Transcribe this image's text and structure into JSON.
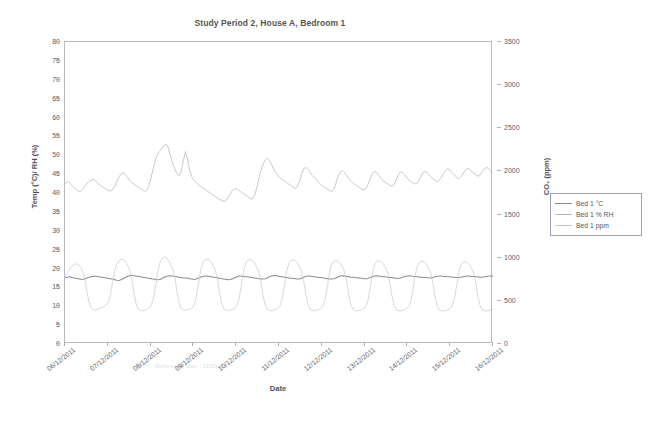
{
  "chart_data": {
    "type": "line",
    "title": "Study Period 2, House A, Bedroom 1",
    "xlabel": "Date",
    "ylabel": "Temp (°C)/ RH (%)",
    "y2label": "CO₂ (ppm)",
    "ylim": [
      0,
      80
    ],
    "y2lim": [
      0,
      3500
    ],
    "grid": false,
    "legend_position": "right",
    "y_ticks": [
      80,
      75,
      70,
      65,
      60,
      55,
      50,
      45,
      40,
      35,
      30,
      25,
      20,
      15,
      10,
      5,
      0
    ],
    "y2_ticks": [
      3500,
      3000,
      2500,
      2000,
      1500,
      1000,
      500,
      0
    ],
    "x_tick_labels": [
      "06/12/2011",
      "07/12/2011",
      "08/12/2011",
      "09/12/2011",
      "10/12/2011",
      "11/12/2011",
      "12/12/2011",
      "13/12/2011",
      "14/12/2011",
      "15/12/2011",
      "16/12/2011"
    ],
    "annotation": "Reference Max - 1100ppm",
    "series": [
      {
        "name": "Bed 1 °C",
        "axis": "left",
        "unit": "°C",
        "color": "#8d8d96",
        "values": [
          17.6,
          17.7,
          17.8,
          17.7,
          17.5,
          17.4,
          17.3,
          17.2,
          17.1,
          17.2,
          17.4,
          17.6,
          17.8,
          17.9,
          18.0,
          17.9,
          17.8,
          17.7,
          17.6,
          17.5,
          17.4,
          17.3,
          17.2,
          17.1,
          16.9,
          16.8,
          17.0,
          17.3,
          17.6,
          17.9,
          18.1,
          18.2,
          18.1,
          18.0,
          17.9,
          17.8,
          17.7,
          17.6,
          17.5,
          17.4,
          17.3,
          17.2,
          17.1,
          17.0,
          17.1,
          17.3,
          17.6,
          17.9,
          18.0,
          18.1,
          18.0,
          17.9,
          17.8,
          17.7,
          17.6,
          17.5,
          17.5,
          17.4,
          17.3,
          17.2,
          17.1,
          17.2,
          17.4,
          17.7,
          17.9,
          18.0,
          18.0,
          17.9,
          17.8,
          17.7,
          17.6,
          17.5,
          17.4,
          17.3,
          17.2,
          17.1,
          17.0,
          17.1,
          17.3,
          17.6,
          17.8,
          18.0,
          18.0,
          17.9,
          17.8,
          17.8,
          17.7,
          17.6,
          17.5,
          17.4,
          17.3,
          17.2,
          17.2,
          17.3,
          17.5,
          17.8,
          18.0,
          18.1,
          18.1,
          18.0,
          17.9,
          17.8,
          17.7,
          17.6,
          17.5,
          17.4,
          17.4,
          17.3,
          17.2,
          17.2,
          17.4,
          17.7,
          17.9,
          18.0,
          18.0,
          17.9,
          17.8,
          17.7,
          17.6,
          17.6,
          17.5,
          17.4,
          17.3,
          17.2,
          17.2,
          17.3,
          17.5,
          17.8,
          18.0,
          18.1,
          18.0,
          17.9,
          17.8,
          17.7,
          17.7,
          17.6,
          17.5,
          17.5,
          17.4,
          17.3,
          17.3,
          17.4,
          17.6,
          17.9,
          18.0,
          18.1,
          18.0,
          17.9,
          17.8,
          17.8,
          17.7,
          17.6,
          17.6,
          17.5,
          17.4,
          17.4,
          17.5,
          17.7,
          17.9,
          18.0,
          18.1,
          18.0,
          17.9,
          17.9,
          17.8,
          17.7,
          17.7,
          17.6,
          17.6,
          17.5,
          17.5,
          17.6,
          17.8,
          17.9,
          18.0,
          18.0,
          17.9,
          17.9,
          17.8,
          17.8,
          17.7,
          17.7,
          17.6,
          17.6,
          17.7,
          17.8,
          17.9,
          18.0,
          18.0,
          17.9,
          17.9,
          17.8,
          17.8,
          17.7,
          17.7,
          17.8,
          17.9,
          18.0,
          18.0,
          17.9
        ]
      },
      {
        "name": "Bed 1 % RH",
        "axis": "left",
        "unit": "%",
        "color": "#b5b5be",
        "values": [
          42.5,
          43.0,
          42.8,
          42.2,
          41.5,
          41.0,
          40.6,
          40.3,
          40.8,
          41.6,
          42.4,
          43.0,
          43.4,
          43.6,
          43.3,
          42.8,
          42.2,
          41.8,
          41.4,
          41.0,
          40.7,
          40.5,
          40.8,
          41.6,
          43.0,
          44.2,
          45.0,
          45.4,
          45.0,
          44.2,
          43.4,
          42.8,
          42.4,
          42.0,
          41.6,
          41.2,
          40.8,
          40.4,
          40.8,
          42.0,
          44.0,
          46.5,
          48.8,
          50.2,
          51.0,
          51.8,
          52.6,
          53.0,
          52.0,
          50.0,
          48.0,
          46.4,
          45.2,
          44.6,
          45.6,
          48.5,
          51.0,
          49.0,
          46.0,
          44.2,
          43.4,
          42.8,
          42.2,
          41.8,
          41.4,
          41.0,
          40.6,
          40.2,
          39.8,
          39.4,
          39.0,
          38.6,
          38.3,
          38.0,
          37.8,
          38.2,
          39.0,
          40.0,
          40.8,
          41.2,
          41.0,
          40.6,
          40.2,
          39.8,
          39.4,
          39.0,
          38.6,
          38.4,
          39.2,
          41.0,
          43.5,
          45.8,
          47.5,
          48.6,
          49.2,
          48.6,
          47.6,
          46.4,
          45.4,
          44.6,
          44.0,
          43.6,
          43.2,
          42.8,
          42.4,
          42.0,
          41.6,
          41.2,
          41.6,
          43.0,
          45.0,
          46.4,
          46.8,
          46.2,
          45.4,
          44.6,
          44.0,
          43.4,
          42.8,
          42.2,
          41.8,
          41.4,
          41.0,
          40.6,
          40.4,
          41.0,
          42.6,
          44.4,
          45.6,
          46.0,
          45.4,
          44.6,
          43.8,
          43.2,
          42.6,
          42.2,
          41.8,
          41.4,
          41.0,
          40.8,
          41.2,
          42.4,
          44.0,
          45.2,
          45.8,
          45.4,
          44.6,
          43.8,
          43.2,
          42.8,
          42.4,
          42.0,
          41.8,
          42.2,
          43.4,
          44.8,
          45.6,
          45.4,
          44.8,
          44.0,
          43.4,
          43.0,
          42.6,
          42.4,
          42.8,
          43.8,
          45.0,
          45.8,
          45.6,
          45.0,
          44.4,
          43.8,
          43.4,
          43.0,
          43.4,
          44.2,
          45.2,
          46.0,
          46.4,
          46.0,
          45.4,
          44.8,
          44.2,
          43.8,
          44.2,
          45.0,
          46.0,
          46.6,
          46.4,
          45.8,
          45.2,
          44.8,
          44.4,
          44.8,
          45.6,
          46.4,
          46.8,
          46.4,
          45.8,
          45.2
        ]
      },
      {
        "name": "Bed 1 ppm",
        "axis": "right",
        "unit": "ppm",
        "color": "#c2c6d6",
        "values": [
          780,
          820,
          860,
          900,
          920,
          930,
          920,
          900,
          860,
          780,
          640,
          500,
          430,
          400,
          395,
          400,
          410,
          420,
          430,
          450,
          480,
          560,
          700,
          840,
          920,
          960,
          980,
          980,
          960,
          920,
          860,
          760,
          600,
          470,
          410,
          390,
          385,
          390,
          400,
          415,
          440,
          520,
          660,
          820,
          930,
          990,
          1010,
          1000,
          970,
          930,
          880,
          780,
          620,
          480,
          415,
          395,
          390,
          395,
          405,
          420,
          450,
          540,
          690,
          850,
          940,
          975,
          985,
          975,
          950,
          905,
          850,
          740,
          580,
          460,
          405,
          390,
          388,
          392,
          402,
          418,
          445,
          530,
          680,
          840,
          935,
          970,
          980,
          970,
          945,
          900,
          845,
          735,
          575,
          458,
          404,
          390,
          387,
          391,
          401,
          417,
          444,
          528,
          675,
          835,
          930,
          965,
          975,
          965,
          940,
          895,
          840,
          730,
          570,
          455,
          402,
          388,
          386,
          390,
          400,
          416,
          443,
          525,
          670,
          830,
          925,
          960,
          970,
          960,
          935,
          890,
          835,
          725,
          565,
          452,
          400,
          387,
          385,
          389,
          399,
          415,
          442,
          522,
          665,
          825,
          920,
          955,
          965,
          955,
          930,
          885,
          830,
          720,
          560,
          450,
          398,
          386,
          384,
          388,
          398,
          414,
          441,
          520,
          660,
          820,
          915,
          950,
          960,
          950,
          925,
          880,
          825,
          715,
          555,
          448,
          396,
          385,
          383,
          387,
          397,
          413,
          440,
          518,
          655,
          815,
          910,
          945,
          955,
          945,
          920,
          875,
          820,
          710,
          550,
          446,
          395,
          384,
          382,
          386,
          396,
          412
        ]
      }
    ]
  },
  "legend": {
    "entries": [
      {
        "label": "Bed 1 °C"
      },
      {
        "label": "Bed 1 % RH"
      },
      {
        "label": "Bed 1 ppm"
      }
    ]
  }
}
